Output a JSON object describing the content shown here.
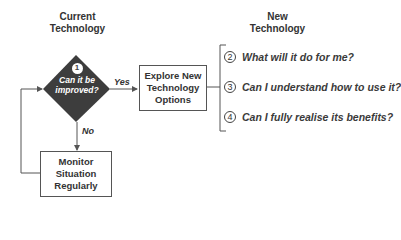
{
  "headers": {
    "current": "Current\nTechnology",
    "current_line1": "Current",
    "current_line2": "Technology",
    "new_line1": "New",
    "new_line2": "Technology"
  },
  "decision": {
    "number": "1",
    "line1": "Can it be",
    "line2": "improved?",
    "fill_color": "#3d3d3d"
  },
  "edges": {
    "yes": "Yes",
    "no": "No"
  },
  "boxes": {
    "explore": {
      "line1": "Explore New",
      "line2": "Technology",
      "line3": "Options"
    },
    "monitor": {
      "line1": "Monitor",
      "line2": "Situation",
      "line3": "Regularly"
    }
  },
  "questions": [
    {
      "number": "2",
      "text": "What will it do for me?"
    },
    {
      "number": "3",
      "text": "Can I understand how to use it?"
    },
    {
      "number": "4",
      "text": "Can I fully realise its benefits?"
    }
  ]
}
